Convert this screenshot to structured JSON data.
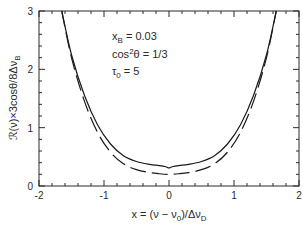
{
  "chart_data": {
    "type": "line",
    "title": "",
    "xlabel": "x = (ν − ν0)/ΔνD",
    "ylabel": "ℛ(ν)×3cosθ/8ΔνB",
    "xlim": [
      -2,
      2
    ],
    "ylim": [
      0,
      3
    ],
    "x_ticks": [
      "-2",
      "-1",
      "0",
      "1",
      "2"
    ],
    "y_ticks": [
      "0",
      "1",
      "2",
      "3"
    ],
    "grid": false,
    "legend": null,
    "annotations": [
      {
        "text": "xB = 0.03",
        "main": "x",
        "sub": "B",
        "rest": " = 0.03"
      },
      {
        "text": "cos²θ = 1/3",
        "main": "cos",
        "sup": "2",
        "rest": "θ = 1/3"
      },
      {
        "text": "τ0 = 5",
        "main": "τ",
        "sub": "0",
        "rest": " = 5"
      }
    ],
    "series": [
      {
        "name": "solid",
        "style": "solid",
        "x": [
          -1.65,
          -1.5,
          -1.3,
          -1.1,
          -0.9,
          -0.7,
          -0.5,
          -0.3,
          -0.15,
          -0.05,
          0.0,
          0.05,
          0.15,
          0.3,
          0.5,
          0.7,
          0.9,
          1.1,
          1.3,
          1.5,
          1.65
        ],
        "values": [
          3.0,
          2.25,
          1.55,
          1.05,
          0.72,
          0.52,
          0.42,
          0.37,
          0.35,
          0.33,
          0.31,
          0.33,
          0.35,
          0.37,
          0.42,
          0.52,
          0.72,
          1.05,
          1.55,
          2.25,
          3.0
        ]
      },
      {
        "name": "dashed",
        "style": "dashed",
        "x": [
          -1.65,
          -1.5,
          -1.3,
          -1.1,
          -0.9,
          -0.7,
          -0.5,
          -0.3,
          -0.15,
          0.0,
          0.15,
          0.3,
          0.5,
          0.7,
          0.9,
          1.1,
          1.3,
          1.5,
          1.65
        ],
        "values": [
          3.0,
          2.2,
          1.45,
          0.92,
          0.58,
          0.38,
          0.28,
          0.23,
          0.21,
          0.2,
          0.21,
          0.23,
          0.28,
          0.38,
          0.58,
          0.92,
          1.45,
          2.2,
          3.0
        ]
      }
    ]
  },
  "labels": {
    "xlabel_prefix": "x = (ν − ν",
    "xlabel_sub0": "0",
    "xlabel_mid": ")/Δν",
    "xlabel_subD": "D",
    "ylabel_main": "ℛ(ν)×3cosθ/8Δν",
    "ylabel_sub": "B",
    "annot1_main": "x",
    "annot1_sub": "B",
    "annot1_rest": " = 0.03",
    "annot2_main": "cos",
    "annot2_sup": "2",
    "annot2_rest": "θ = 1/3",
    "annot3_main": "τ",
    "annot3_sub": "0",
    "annot3_rest": " = 5"
  },
  "colors": {
    "line": "#1a1a1a",
    "axis": "#2a2a2a"
  }
}
